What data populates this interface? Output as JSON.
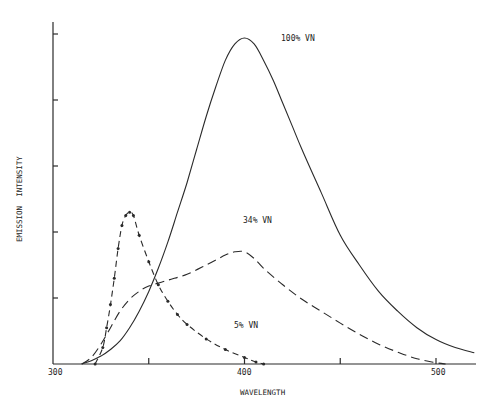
{
  "chart_data": {
    "type": "line",
    "title": "",
    "xlabel": "WAVELENGTH",
    "ylabel": "EMISSION  INTENSITY",
    "xlim": [
      300,
      521
    ],
    "ylim": [
      0,
      5.1
    ],
    "x_ticks": [
      300,
      350,
      400,
      450,
      500
    ],
    "x_tick_labels": [
      "300",
      "",
      "400",
      "",
      "500"
    ],
    "y_ticks": [
      1,
      2,
      3,
      4,
      5
    ],
    "y_tick_labels": [
      "",
      "",
      "",
      "",
      ""
    ],
    "grid": false,
    "legend": "inline annotations",
    "series": [
      {
        "name": "100% VN",
        "style": "solid",
        "label_pos": [
          318,
          4.95
        ],
        "x": [
          315,
          320,
          325,
          330,
          335,
          340,
          345,
          350,
          355,
          360,
          365,
          370,
          375,
          380,
          385,
          390,
          395,
          400,
          405,
          410,
          415,
          420,
          425,
          430,
          440,
          450,
          460,
          470,
          480,
          490,
          500,
          510,
          520
        ],
        "y": [
          0.0,
          0.05,
          0.12,
          0.22,
          0.35,
          0.55,
          0.8,
          1.1,
          1.45,
          1.85,
          2.3,
          2.75,
          3.25,
          3.75,
          4.2,
          4.6,
          4.85,
          4.94,
          4.85,
          4.6,
          4.3,
          3.95,
          3.6,
          3.25,
          2.6,
          1.95,
          1.5,
          1.1,
          0.8,
          0.55,
          0.37,
          0.25,
          0.17
        ]
      },
      {
        "name": "34% VN",
        "style": "dashed",
        "label_pos": [
          398,
          2.1
        ],
        "x": [
          315,
          320,
          325,
          330,
          335,
          340,
          345,
          350,
          360,
          370,
          380,
          390,
          395,
          400,
          405,
          410,
          420,
          430,
          440,
          450,
          460,
          470,
          480,
          490,
          500,
          505
        ],
        "y": [
          0.0,
          0.1,
          0.3,
          0.55,
          0.8,
          0.98,
          1.1,
          1.18,
          1.27,
          1.36,
          1.5,
          1.65,
          1.7,
          1.7,
          1.6,
          1.45,
          1.2,
          0.98,
          0.8,
          0.62,
          0.45,
          0.3,
          0.18,
          0.08,
          0.02,
          0.0
        ]
      },
      {
        "name": "5% VN",
        "style": "dash-dot",
        "label_pos": [
          383,
          0.95
        ],
        "x": [
          322,
          326,
          328,
          330,
          332,
          334,
          336,
          338,
          340,
          342,
          345,
          350,
          355,
          360,
          365,
          370,
          380,
          390,
          400,
          406,
          410
        ],
        "y": [
          0.0,
          0.25,
          0.55,
          0.9,
          1.3,
          1.75,
          2.1,
          2.25,
          2.3,
          2.25,
          1.95,
          1.55,
          1.2,
          0.95,
          0.75,
          0.6,
          0.38,
          0.22,
          0.1,
          0.03,
          0.0
        ]
      }
    ]
  },
  "axes": {
    "x_label": "WAVELENGTH",
    "y_label": "EMISSION  INTENSITY",
    "x_tick_300": "300",
    "x_tick_400": "400",
    "x_tick_500": "500"
  },
  "annotations": {
    "label_100": "100% VN",
    "label_34": "34% VN",
    "label_5": "5% VN"
  },
  "colors": {
    "ink": "#2a2a2a",
    "background": "#ffffff"
  }
}
